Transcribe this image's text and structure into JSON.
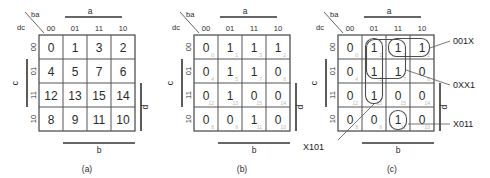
{
  "figure": {
    "type": "karnaugh-maps",
    "variables": {
      "top": "a",
      "bottom": "b",
      "left": "c",
      "right": "d"
    },
    "corner": {
      "upper": "ba",
      "lower": "dc"
    },
    "col_headers": [
      "00",
      "01",
      "11",
      "10"
    ],
    "row_headers": [
      "00",
      "01",
      "11",
      "10"
    ]
  },
  "maps": [
    {
      "caption": "(a)",
      "kind": "minterm-index",
      "rows": [
        [
          "0",
          "1",
          "3",
          "2"
        ],
        [
          "4",
          "5",
          "7",
          "6"
        ],
        [
          "12",
          "13",
          "15",
          "14"
        ],
        [
          "8",
          "9",
          "11",
          "10"
        ]
      ]
    },
    {
      "caption": "(b)",
      "kind": "values",
      "rows": [
        [
          "0",
          "1",
          "1",
          "1"
        ],
        [
          "0",
          "1",
          "1",
          "0"
        ],
        [
          "0",
          "1",
          "0",
          "0"
        ],
        [
          "0",
          "0",
          "1",
          "0"
        ]
      ],
      "index_rows": [
        [
          "0",
          "1",
          "3",
          "2"
        ],
        [
          "4",
          "5",
          "7",
          "6"
        ],
        [
          "12",
          "13",
          "15",
          "14"
        ],
        [
          "8",
          "9",
          "11",
          "10"
        ]
      ]
    },
    {
      "caption": "(c)",
      "kind": "values-grouped",
      "rows": [
        [
          "0",
          "1",
          "1",
          "1"
        ],
        [
          "0",
          "1",
          "1",
          "0"
        ],
        [
          "0",
          "1",
          "0",
          "0"
        ],
        [
          "0",
          "0",
          "1",
          "0"
        ]
      ],
      "index_rows": [
        [
          "0",
          "1",
          "3",
          "2"
        ],
        [
          "4",
          "5",
          "7",
          "6"
        ],
        [
          "12",
          "13",
          "15",
          "14"
        ],
        [
          "8",
          "9",
          "11",
          "10"
        ]
      ],
      "groups": [
        {
          "name": "group-001x",
          "label": "001X",
          "cells": "row00 col11+col10"
        },
        {
          "name": "group-0xx1",
          "label": "0XX1",
          "cells": "row00-01 col01-11"
        },
        {
          "name": "group-x101",
          "label": "X101",
          "cells": "row00-01-11 col01"
        },
        {
          "name": "group-x011",
          "label": "X011",
          "cells": "row10 col11"
        }
      ]
    }
  ],
  "colors": {
    "grid": "#555555",
    "oval": "#4d4d4d",
    "text": "#1a1a1a",
    "ghost": "#b9b9b9",
    "background": "#ffffff"
  }
}
